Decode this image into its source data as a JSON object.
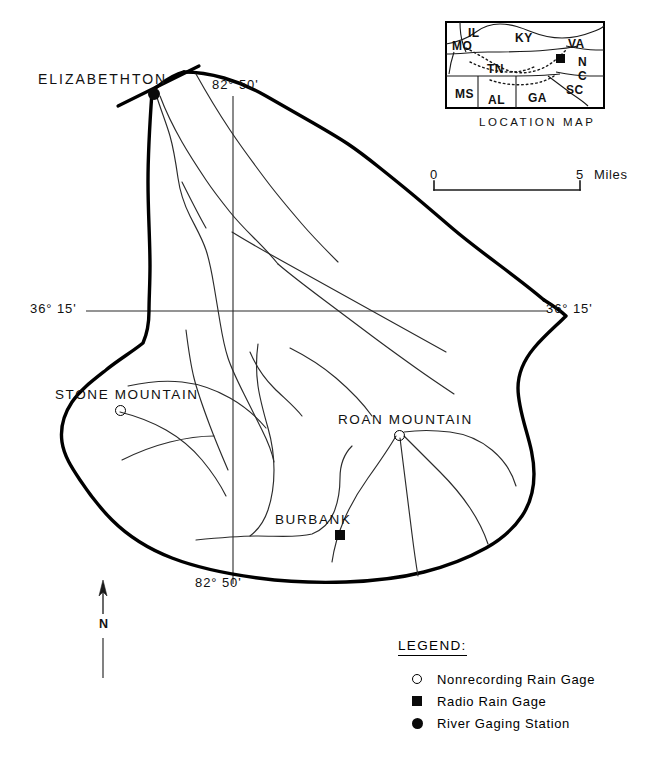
{
  "map": {
    "title": "Doe River watershed map",
    "type": "watershed-drainage-map",
    "colors": {
      "ink": "#000000",
      "background": "#ffffff",
      "boundary": "#000000",
      "stream": "#222222"
    },
    "city_labels": [
      {
        "name": "elizabethton",
        "text": "ELIZABETHTON",
        "x": 38,
        "y": 72
      }
    ],
    "place_labels": [
      {
        "name": "stone-mountain",
        "text": "STONE MOUNTAIN",
        "x": 55,
        "y": 388
      },
      {
        "name": "roan-mountain",
        "text": "ROAN MOUNTAIN",
        "x": 338,
        "y": 413
      },
      {
        "name": "burbank",
        "text": "BURBANK",
        "x": 275,
        "y": 513
      }
    ],
    "coordinate_labels": [
      {
        "name": "longitude-top",
        "text": "82° 50'",
        "x": 212,
        "y": 78
      },
      {
        "name": "longitude-bottom",
        "text": "82° 50'",
        "x": 195,
        "y": 576
      },
      {
        "name": "latitude-left",
        "text": "36° 15'",
        "x": 30,
        "y": 302
      },
      {
        "name": "latitude-right",
        "text": "36° 15'",
        "x": 546,
        "y": 302
      }
    ],
    "markers": [
      {
        "name": "river-gaging-station-elizabethton",
        "symbol": "filled-circle",
        "x": 148,
        "y": 88
      },
      {
        "name": "nonrecording-rain-gage-stone-mountain",
        "symbol": "open-circle",
        "x": 115,
        "y": 405
      },
      {
        "name": "nonrecording-rain-gage-roan-mountain",
        "symbol": "open-circle",
        "x": 394,
        "y": 430
      },
      {
        "name": "radio-rain-gage-burbank",
        "symbol": "filled-square",
        "x": 335,
        "y": 530
      }
    ],
    "scale_bar": {
      "start_label": "0",
      "end_label": "5",
      "units_label": "Miles",
      "x1": 434,
      "x2": 580,
      "y": 190
    },
    "north_arrow": {
      "label": "N",
      "x": 103,
      "y_top": 580,
      "y_bottom": 678
    },
    "legend": {
      "title": "LEGEND:",
      "items": [
        {
          "symbol": "open-circle",
          "label": "Nonrecording Rain Gage"
        },
        {
          "symbol": "filled-square",
          "label": "Radio Rain Gage"
        },
        {
          "symbol": "filled-circle",
          "label": "River Gaging Station"
        }
      ]
    },
    "inset": {
      "title": "LOCATION MAP",
      "frame": {
        "x": 446,
        "y": 22,
        "width": 158,
        "height": 86
      },
      "states": [
        {
          "abbr": "MO",
          "x": 452,
          "y": 40
        },
        {
          "abbr": "IL",
          "x": 468,
          "y": 27
        },
        {
          "abbr": "KY",
          "x": 515,
          "y": 32
        },
        {
          "abbr": "VA",
          "x": 568,
          "y": 38
        },
        {
          "abbr": "TN",
          "x": 487,
          "y": 63
        },
        {
          "abbr": "N",
          "x": 578,
          "y": 56
        },
        {
          "abbr": "C",
          "x": 578,
          "y": 70
        },
        {
          "abbr": "MS",
          "x": 455,
          "y": 88
        },
        {
          "abbr": "AL",
          "x": 488,
          "y": 94
        },
        {
          "abbr": "GA",
          "x": 528,
          "y": 92
        },
        {
          "abbr": "SC",
          "x": 566,
          "y": 84
        }
      ],
      "study_area_marker": {
        "name": "study-area-marker",
        "symbol": "filled-square",
        "x": 556,
        "y": 54
      }
    }
  }
}
